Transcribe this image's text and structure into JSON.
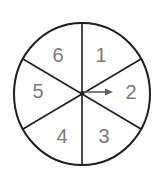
{
  "spinner": {
    "sections": [
      {
        "label": "1"
      },
      {
        "label": "2"
      },
      {
        "label": "3"
      },
      {
        "label": "4"
      },
      {
        "label": "5"
      },
      {
        "label": "6"
      }
    ],
    "section_count": 6,
    "pointer_direction": "right",
    "pointer_points_to": "2",
    "colors": {
      "outline": "#1e1e1e",
      "label": "#7a7a7a",
      "pointer": "#5f5f5f"
    }
  }
}
